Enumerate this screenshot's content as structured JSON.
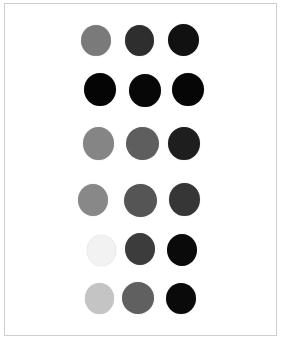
{
  "image": {
    "width": 281,
    "height": 340,
    "background": "#ffffff",
    "frame": {
      "left": 4,
      "top": 3,
      "right": 277,
      "bottom": 336,
      "border_color": "#cfcfcf"
    }
  },
  "grid": {
    "rows": 6,
    "cols": 3,
    "dots": [
      [
        {
          "cx": 96,
          "cy": 40,
          "rx": 15,
          "ry": 15.5,
          "color": "#7a7a7a"
        },
        {
          "cx": 139,
          "cy": 40,
          "rx": 14.5,
          "ry": 15.5,
          "color": "#2e2e2e"
        },
        {
          "cx": 183,
          "cy": 40,
          "rx": 15.5,
          "ry": 16,
          "color": "#111111"
        }
      ],
      [
        {
          "cx": 100,
          "cy": 89,
          "rx": 16,
          "ry": 16.5,
          "color": "#050505"
        },
        {
          "cx": 145,
          "cy": 90,
          "rx": 16,
          "ry": 16.5,
          "color": "#070707"
        },
        {
          "cx": 188,
          "cy": 89,
          "rx": 16,
          "ry": 16.5,
          "color": "#060606"
        }
      ],
      [
        {
          "cx": 98,
          "cy": 143,
          "rx": 15.5,
          "ry": 16.5,
          "color": "#858585"
        },
        {
          "cx": 142,
          "cy": 143,
          "rx": 16.5,
          "ry": 16.5,
          "color": "#5e5e5e"
        },
        {
          "cx": 184,
          "cy": 143,
          "rx": 16,
          "ry": 16.5,
          "color": "#1e1e1e"
        }
      ],
      [
        {
          "cx": 93,
          "cy": 200,
          "rx": 15,
          "ry": 16,
          "color": "#888888"
        },
        {
          "cx": 140,
          "cy": 200,
          "rx": 16.5,
          "ry": 16.5,
          "color": "#555555"
        },
        {
          "cx": 184,
          "cy": 199,
          "rx": 15.5,
          "ry": 16.5,
          "color": "#363636"
        }
      ],
      [
        {
          "cx": 101,
          "cy": 250,
          "rx": 14.5,
          "ry": 15.5,
          "color": "#f2f2f2"
        },
        {
          "cx": 140,
          "cy": 249,
          "rx": 15,
          "ry": 16,
          "color": "#3c3c3c"
        },
        {
          "cx": 182,
          "cy": 250,
          "rx": 15,
          "ry": 16,
          "color": "#0a0a0a"
        }
      ],
      [
        {
          "cx": 99,
          "cy": 298,
          "rx": 14.5,
          "ry": 15.5,
          "color": "#c4c4c4"
        },
        {
          "cx": 138,
          "cy": 298,
          "rx": 16,
          "ry": 16,
          "color": "#606060"
        },
        {
          "cx": 181,
          "cy": 298,
          "rx": 15,
          "ry": 15.5,
          "color": "#0a0a0a"
        }
      ]
    ]
  }
}
